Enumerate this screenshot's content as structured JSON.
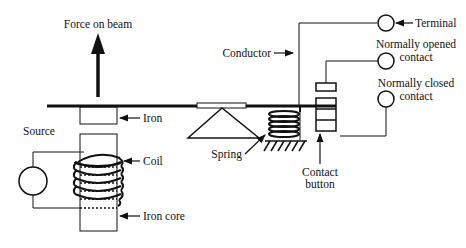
{
  "diagram": {
    "labels": {
      "force": "Force on beam",
      "iron": "Iron",
      "source": "Source",
      "coil": "Coil",
      "iron_core": "Iron core",
      "spring": "Spring",
      "conductor": "Conductor",
      "terminal": "Terminal",
      "no_contact_line1": "Normally opened",
      "no_contact_line2": "contact",
      "nc_contact_line1": "Normally closed",
      "nc_contact_line2": "contact",
      "contact_button_line1": "Contact",
      "contact_button_line2": "button"
    },
    "colors": {
      "stroke": "#111111",
      "background": "#ffffff"
    }
  }
}
